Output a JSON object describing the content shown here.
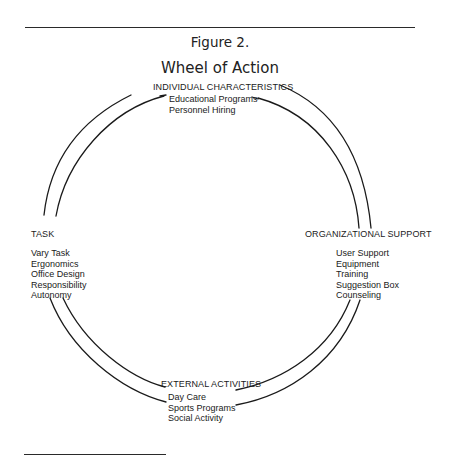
{
  "figure": {
    "label": "Figure 2.",
    "title": "Wheel of Action"
  },
  "sections": {
    "top": {
      "heading": "INDIVIDUAL CHARACTERISTICS",
      "items": [
        "Educational Programs",
        "Personnel Hiring"
      ]
    },
    "left": {
      "heading": "TASK",
      "items": [
        "Vary Task",
        "Ergonomics",
        "Office Design",
        "Responsibility",
        "Autonomy"
      ]
    },
    "right": {
      "heading": "ORGANIZATIONAL SUPPORT",
      "items": [
        "User Support",
        "Equipment",
        "Training",
        "Suggestion Box",
        "Counseling"
      ]
    },
    "bottom": {
      "heading": "EXTERNAL ACTIVITIES",
      "items": [
        "Day Care",
        "Sports Programs",
        "Social Activity"
      ]
    }
  },
  "colors": {
    "line": "#1a1a1a",
    "text": "#1a1a1a",
    "background": "#ffffff"
  }
}
